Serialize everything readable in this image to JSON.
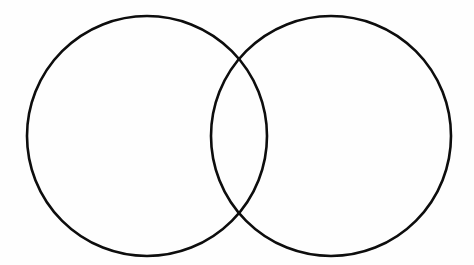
{
  "diagram": {
    "background_color": "#fefefe",
    "stroke_color": "#0d0d0d",
    "stroke_width": 2.6,
    "canvas": {
      "width": 474,
      "height": 265
    },
    "circles": [
      {
        "id": "left-circle",
        "cx": 147,
        "cy": 136,
        "r": 120
      },
      {
        "id": "right-circle",
        "cx": 331,
        "cy": 136,
        "r": 120
      }
    ]
  }
}
